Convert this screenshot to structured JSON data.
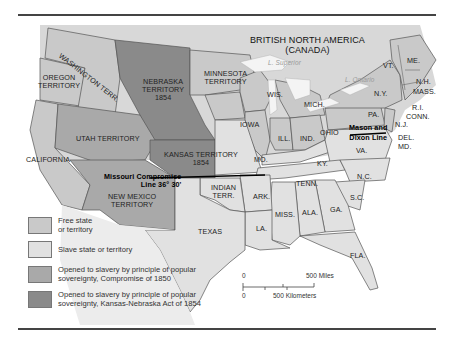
{
  "map": {
    "title_region": "British North America (Canada)",
    "colors": {
      "free": "#c9c9c9",
      "slave": "#e1e1e1",
      "compromise_1850": "#a9a9a9",
      "kansas_nebraska_1854": "#8a8a8a",
      "water": "#f2f2f2",
      "border": "#555555",
      "background": "#ffffff"
    },
    "labels": {
      "canada_line1": "BRITISH NORTH AMERICA",
      "canada_line2": "(CANADA)",
      "washington": "WASHINGTON TERR.",
      "oregon_line1": "OREGON",
      "oregon_line2": "TERRITORY",
      "nebraska_line1": "NEBRASKA",
      "nebraska_line2": "TERRITORY",
      "nebraska_line3": "1854",
      "minnesota_line1": "MINNESOTA",
      "minnesota_line2": "TERRITORY",
      "utah": "UTAH TERRITORY",
      "california": "CALIFORNIA",
      "kansas_line1": "KANSAS TERRITORY",
      "kansas_line2": "1854",
      "new_mexico_line1": "NEW MEXICO",
      "new_mexico_line2": "TERRITORY",
      "missouri_compromise_line1": "Missouri Compromise",
      "missouri_compromise_line2": "Line 36° 30'",
      "indian_line1": "INDIAN",
      "indian_line2": "TERR.",
      "texas": "TEXAS",
      "iowa": "IOWA",
      "wis": "WIS.",
      "mich": "MICH.",
      "ill": "ILL.",
      "ind": "IND.",
      "ohio": "OHIO",
      "mo": "MO.",
      "ky": "KY.",
      "tenn": "TENN.",
      "ark": "ARK.",
      "la": "LA.",
      "miss": "MISS.",
      "ala": "ALA.",
      "ga": "GA.",
      "fla": "FLA.",
      "sc": "S.C.",
      "nc": "N.C.",
      "va": "VA.",
      "md": "MD.",
      "del": "DEL.",
      "nj": "N.J.",
      "pa": "PA.",
      "ny": "N.Y.",
      "conn": "CONN.",
      "ri": "R.I.",
      "mass": "MASS.",
      "nh": "N.H.",
      "vt": "VT.",
      "me": "ME.",
      "mason_dixon_line1": "Mason and",
      "mason_dixon_line2": "Dixon Line",
      "lake_superior": "L. Superior",
      "lake_ontario": "L. Ontario"
    }
  },
  "legend": {
    "items": [
      {
        "label_line1": "Free state",
        "label_line2": "or territory",
        "color": "#c9c9c9"
      },
      {
        "label_line1": "Slave state or territory",
        "label_line2": "",
        "color": "#e1e1e1"
      },
      {
        "label_line1": "Opened to slavery by principle of popular",
        "label_line2": "sovereignty, Compromise of 1850",
        "color": "#a9a9a9"
      },
      {
        "label_line1": "Opened to slavery by principle of popular",
        "label_line2": "sovereignty, Kansas-Nebraska Act of 1854",
        "color": "#8a8a8a"
      }
    ]
  },
  "scale": {
    "zero_top": "0",
    "miles": "500 Miles",
    "zero_bottom": "0",
    "kilometers": "500 Kilometers"
  }
}
